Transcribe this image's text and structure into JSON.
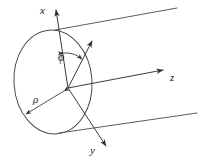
{
  "figure": {
    "kind": "cylindrical-coordinate-diagram",
    "background_color": "#ffffff",
    "line_color": "#3a3a3a",
    "labels": {
      "x_axis": "x",
      "y_axis": "y",
      "z_axis": "z",
      "azimuth_angle": "ϕ",
      "radius": "ρ"
    },
    "geometry": {
      "origin": {
        "x": 68,
        "y": 88
      },
      "circle": {
        "center_x": 53,
        "center_y": 82,
        "radius_x": 39,
        "radius_y": 52,
        "rotation_deg": -4
      },
      "x_axis_tip": {
        "x": 56,
        "y": 4
      },
      "y_axis_tip": {
        "x": 111,
        "y": 152
      },
      "z_axis_tip": {
        "x": 168,
        "y": 69
      },
      "radial_arrow_tip": {
        "x": 96,
        "y": 36
      },
      "rho_arrow_tip": {
        "x": 22,
        "y": 117
      },
      "cylinder_top_line": {
        "x1": 55,
        "y1": 30,
        "x2": 177,
        "y2": 8
      },
      "cylinder_bottom_line": {
        "x1": 59,
        "y1": 133,
        "x2": 197,
        "y2": 113
      }
    }
  }
}
